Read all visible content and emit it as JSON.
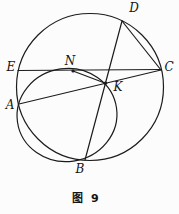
{
  "figure": {
    "caption": "图 9",
    "stroke_color": "#1c1c1c",
    "background": "#fcfcfc",
    "big_circle": {
      "cx": 90,
      "cy": 87,
      "r": 73.5
    },
    "small_circle": {
      "cx": 67,
      "cy": 115,
      "rx": 50,
      "ry": 46.5,
      "rotation": -8
    },
    "lines": [
      {
        "name": "chord-EC",
        "x1": 18,
        "y1": 70.5,
        "x2": 161,
        "y2": 69.5
      },
      {
        "name": "chord-AC",
        "x1": 19,
        "y1": 104,
        "x2": 161,
        "y2": 70
      },
      {
        "name": "chord-DB",
        "x1": 122,
        "y1": 21,
        "x2": 85,
        "y2": 160
      },
      {
        "name": "chord-DC",
        "x1": 122,
        "y1": 21,
        "x2": 161,
        "y2": 70
      },
      {
        "name": "segment-NK",
        "x1": 73,
        "y1": 71,
        "x2": 105.4,
        "y2": 83.3
      }
    ],
    "dots": [
      {
        "name": "point-N",
        "cx": 73,
        "cy": 71,
        "r": 1.6
      },
      {
        "name": "point-K",
        "cx": 105.4,
        "cy": 83.3,
        "r": 1.8
      }
    ],
    "labels": [
      {
        "text": "E",
        "x": 11,
        "y": 67
      },
      {
        "text": "N",
        "x": 70,
        "y": 61
      },
      {
        "text": "D",
        "x": 134,
        "y": 8
      },
      {
        "text": "C",
        "x": 169,
        "y": 67
      },
      {
        "text": "A",
        "x": 10,
        "y": 105
      },
      {
        "text": "K",
        "x": 118,
        "y": 87
      },
      {
        "text": "B",
        "x": 80,
        "y": 169
      }
    ]
  }
}
